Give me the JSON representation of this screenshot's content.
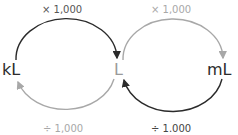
{
  "units": {
    "left": "kL",
    "center": "L",
    "right": "mL"
  },
  "operations": {
    "kl_to_l": "× 1,000",
    "l_to_ml": "× 1,000",
    "l_to_kl": "÷ 1,000",
    "ml_to_l": "÷ 1.000"
  },
  "colors": {
    "dark": "#2b2b2b",
    "light": "#a8a8a8",
    "center_unit": "#9a9a9a"
  }
}
